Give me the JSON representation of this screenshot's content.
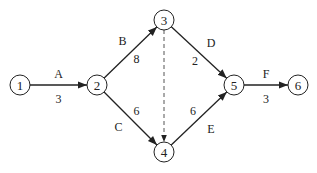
{
  "diagram": {
    "type": "activity-on-arrow network",
    "nodes": [
      {
        "id": "1",
        "label": "1",
        "x": 20,
        "y": 85
      },
      {
        "id": "2",
        "label": "2",
        "x": 97,
        "y": 85
      },
      {
        "id": "3",
        "label": "3",
        "x": 164,
        "y": 20
      },
      {
        "id": "4",
        "label": "4",
        "x": 164,
        "y": 152
      },
      {
        "id": "5",
        "label": "5",
        "x": 234,
        "y": 85
      },
      {
        "id": "6",
        "label": "6",
        "x": 298,
        "y": 85
      }
    ],
    "edges": [
      {
        "from": "1",
        "to": "2",
        "activity": "A",
        "duration": "3",
        "dummy": false
      },
      {
        "from": "2",
        "to": "3",
        "activity": "B",
        "duration": "8",
        "dummy": false
      },
      {
        "from": "2",
        "to": "4",
        "activity": "C",
        "duration": "6",
        "dummy": false
      },
      {
        "from": "3",
        "to": "5",
        "activity": "D",
        "duration": "2",
        "dummy": false
      },
      {
        "from": "4",
        "to": "5",
        "activity": "E",
        "duration": "6",
        "dummy": false
      },
      {
        "from": "5",
        "to": "6",
        "activity": "F",
        "duration": "3",
        "dummy": false
      },
      {
        "from": "3",
        "to": "4",
        "activity": "",
        "duration": "",
        "dummy": true
      }
    ]
  }
}
